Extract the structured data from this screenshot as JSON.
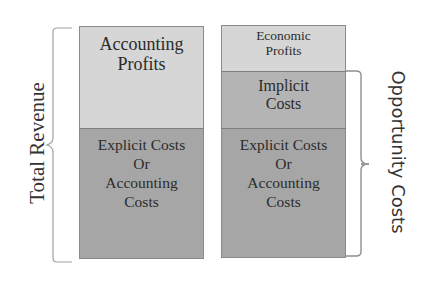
{
  "left_column": {
    "top": {
      "lines": [
        "Accounting",
        "Profits"
      ]
    },
    "bottom": {
      "lines": [
        "Explicit Costs",
        "Or",
        "Accounting",
        "Costs"
      ]
    },
    "brace_label": "Total Revenue"
  },
  "right_column": {
    "top": {
      "lines": [
        "Economic",
        "Profits"
      ]
    },
    "middle": {
      "lines": [
        "Implicit",
        "Costs"
      ]
    },
    "bottom": {
      "lines": [
        "Explicit Costs",
        "Or",
        "Accounting",
        "Costs"
      ]
    },
    "brace_label": "Opportunity Costs"
  },
  "colors": {
    "light_fill": "#d6d6d6",
    "dark_fill": "#a6a6a6",
    "border": "#8a8a8a",
    "text": "#2b2b2b"
  }
}
